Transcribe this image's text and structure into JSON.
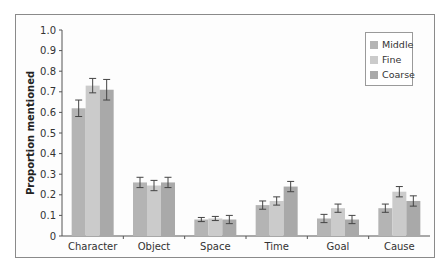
{
  "chart_data": {
    "type": "bar",
    "title": "",
    "xlabel": "",
    "ylabel": "Proportion mentioned",
    "ylim": [
      0,
      1.0
    ],
    "yticks": [
      "0",
      "0.1",
      "0.2",
      "0.3",
      "0.4",
      "0.5",
      "0.6",
      "0.7",
      "0.8",
      "0.9",
      "1.0"
    ],
    "grid": false,
    "legend_position": "upper right",
    "categories": [
      "Character",
      "Object",
      "Space",
      "Time",
      "Goal",
      "Cause"
    ],
    "series": [
      {
        "name": "Middle",
        "color": "#b4b4b4",
        "values": [
          0.62,
          0.26,
          0.08,
          0.15,
          0.085,
          0.135
        ],
        "errors": [
          0.04,
          0.025,
          0.01,
          0.02,
          0.02,
          0.02
        ]
      },
      {
        "name": "Fine",
        "color": "#cbcbcb",
        "values": [
          0.73,
          0.245,
          0.085,
          0.17,
          0.135,
          0.215
        ],
        "errors": [
          0.035,
          0.025,
          0.01,
          0.02,
          0.02,
          0.025
        ]
      },
      {
        "name": "Coarse",
        "color": "#a9a9a9",
        "values": [
          0.71,
          0.26,
          0.08,
          0.24,
          0.08,
          0.17
        ],
        "errors": [
          0.05,
          0.025,
          0.02,
          0.025,
          0.02,
          0.025
        ]
      }
    ]
  },
  "legend": {
    "items": [
      {
        "label": "Middle",
        "color": "#b4b4b4"
      },
      {
        "label": "Fine",
        "color": "#cbcbcb"
      },
      {
        "label": "Coarse",
        "color": "#a9a9a9"
      }
    ]
  }
}
